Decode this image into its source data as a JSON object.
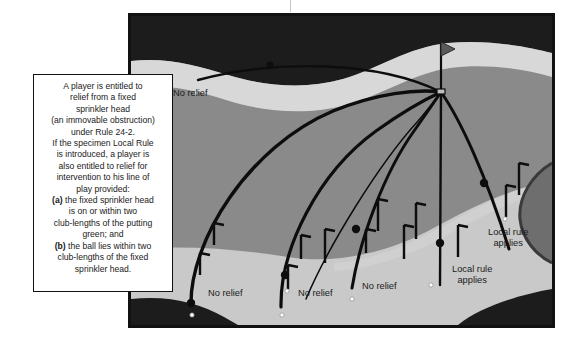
{
  "figure": {
    "title_hidden": "Golf rule diagram: relief from fixed sprinkler head",
    "colors": {
      "border": "#111111",
      "rough_dark": "#1c1c1c",
      "fairway_mid": "#8a8a8a",
      "apron_light": "#c9c9c9",
      "path_pale": "#d8d8d8",
      "bunker_dark": "#6e6e6e",
      "line": "#0d0d0d",
      "ball_fill": "#ffffff",
      "callout_bg": "#ffffff",
      "text": "#1a1a1a"
    }
  },
  "callout": {
    "name": "rule-explanation-box",
    "text": "A player is entitled to\nrelief from a fixed\nsprinkler head\n(an immovable obstruction)\nunder Rule 24-2.\nIf the specimen Local Rule\nis introduced, a player is\nalso entitled to relief for\nintervention to his line of\nplay provided:\n(a) the fixed sprinkler head\nis on or within two\nclub-lengths of the putting\ngreen; and\n(b) the ball lies within two\nclub-lengths of the fixed\nsprinkler head.",
    "lines": [
      "A player is entitled to",
      "relief from a fixed",
      "sprinkler head",
      "(an immovable obstruction)",
      "under Rule 24-2.",
      "If the specimen Local Rule",
      "is introduced, a player is",
      "also entitled to relief for",
      "intervention to his line of",
      "play provided:",
      "(a) the fixed sprinkler head",
      "is on or within two",
      "club-lengths of the putting",
      "green; and",
      "(b) the ball lies within two",
      "club-lengths of the fixed",
      "sprinkler head."
    ]
  },
  "labels": [
    {
      "id": "no-relief-top",
      "text": "No relief",
      "x": 173,
      "y": 88,
      "align": "left"
    },
    {
      "id": "no-relief-1",
      "text": "No relief",
      "x": 208,
      "y": 288,
      "align": "left"
    },
    {
      "id": "no-relief-2",
      "text": "No relief",
      "x": 298,
      "y": 288,
      "align": "left"
    },
    {
      "id": "no-relief-3",
      "text": "No relief",
      "x": 362,
      "y": 281,
      "align": "left"
    },
    {
      "id": "local-rule-1",
      "text": "Local rule\napplies",
      "x": 452,
      "y": 264,
      "align": "left"
    },
    {
      "id": "local-rule-2",
      "text": "Local rule\napplies",
      "x": 488,
      "y": 227,
      "align": "left"
    }
  ],
  "hole": {
    "name": "hole-and-flagstick",
    "x": 441,
    "y": 92,
    "flag_top_y": 42
  },
  "balls": [
    {
      "id": "ball-top",
      "x": 196,
      "y": 79
    },
    {
      "id": "ball-1",
      "x": 189,
      "y": 305
    },
    {
      "id": "ball-2",
      "x": 280,
      "y": 305
    },
    {
      "id": "ball-3",
      "x": 352,
      "y": 292
    },
    {
      "id": "ball-4",
      "x": 431,
      "y": 285
    },
    {
      "id": "ball-5",
      "x": 509,
      "y": 248
    }
  ],
  "markers": {
    "name": "sprinkler-head-markers",
    "count": 12,
    "shape": "L-bracket"
  },
  "play_lines": {
    "count": 6,
    "description": "Lines of play converging at the hole"
  }
}
